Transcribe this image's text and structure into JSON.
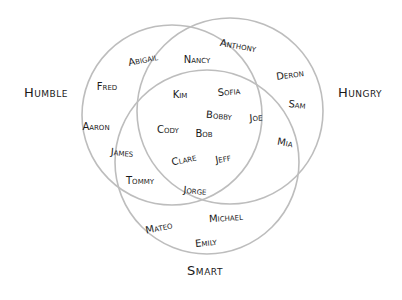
{
  "chart_data": {
    "type": "venn",
    "title": "",
    "sets": [
      {
        "name": "Humble",
        "circle": {
          "cx": 172,
          "cy": 115,
          "r": 90
        },
        "label_pos": [
          46,
          92
        ]
      },
      {
        "name": "Hungry",
        "circle": {
          "cx": 230,
          "cy": 111,
          "r": 93
        },
        "label_pos": [
          360,
          92
        ]
      },
      {
        "name": "Smart",
        "circle": {
          "cx": 207,
          "cy": 162,
          "r": 92
        },
        "label_pos": [
          205,
          270
        ]
      }
    ],
    "stroke_color": "#bdbdbd",
    "text_color": "#1a1a1a",
    "regions": {
      "Humble only": [
        "Abigail",
        "Fred",
        "Aaron"
      ],
      "Hungry only": [
        "Anthony",
        "Deron",
        "Sam"
      ],
      "Smart only": [
        "Mateo",
        "Michael",
        "Emily"
      ],
      "Humble & Hungry": [
        "Nancy"
      ],
      "Humble & Smart": [
        "James",
        "Tommy"
      ],
      "Hungry & Smart": [
        "Mia"
      ],
      "Humble & Hungry & Smart": [
        "Kim",
        "Sofia",
        "Bobby",
        "Joe",
        "Cody",
        "Bob",
        "Clare",
        "Jeff",
        "Jorge"
      ]
    },
    "names": [
      {
        "text": "Abigail",
        "x": 143,
        "y": 60,
        "rot": -12
      },
      {
        "text": "Fred",
        "x": 107,
        "y": 87,
        "rot": 0
      },
      {
        "text": "Aaron",
        "x": 96,
        "y": 127,
        "rot": 0
      },
      {
        "text": "Nancy",
        "x": 197,
        "y": 60,
        "rot": 0
      },
      {
        "text": "Anthony",
        "x": 238,
        "y": 46,
        "rot": 10
      },
      {
        "text": "Deron",
        "x": 290,
        "y": 75,
        "rot": -8
      },
      {
        "text": "Sam",
        "x": 297,
        "y": 105,
        "rot": 6
      },
      {
        "text": "Kim",
        "x": 180,
        "y": 95,
        "rot": 0
      },
      {
        "text": "Sofia",
        "x": 229,
        "y": 92,
        "rot": -5
      },
      {
        "text": "Bobby",
        "x": 219,
        "y": 116,
        "rot": 5
      },
      {
        "text": "Joe",
        "x": 256,
        "y": 118,
        "rot": -5
      },
      {
        "text": "Cody",
        "x": 168,
        "y": 130,
        "rot": 0
      },
      {
        "text": "Bob",
        "x": 204,
        "y": 134,
        "rot": 0
      },
      {
        "text": "Mia",
        "x": 285,
        "y": 143,
        "rot": 10
      },
      {
        "text": "James",
        "x": 122,
        "y": 153,
        "rot": 5
      },
      {
        "text": "Clare",
        "x": 184,
        "y": 160,
        "rot": -12
      },
      {
        "text": "Jeff",
        "x": 223,
        "y": 159,
        "rot": -10
      },
      {
        "text": "Tommy",
        "x": 140,
        "y": 181,
        "rot": 0
      },
      {
        "text": "Jorge",
        "x": 195,
        "y": 191,
        "rot": 5
      },
      {
        "text": "Mateo",
        "x": 159,
        "y": 228,
        "rot": -12
      },
      {
        "text": "Michael",
        "x": 226,
        "y": 218,
        "rot": -4
      },
      {
        "text": "Emily",
        "x": 206,
        "y": 243,
        "rot": -6
      }
    ]
  }
}
